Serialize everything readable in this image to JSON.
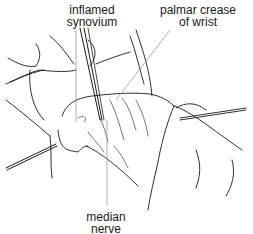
{
  "figure": {
    "labels": {
      "inflamed_synovium": {
        "line1": "inflamed",
        "line2": "synovium"
      },
      "palmar_crease": {
        "line1": "palmar crease",
        "line2": "of wrist"
      },
      "median_nerve": {
        "line1": "median",
        "line2": "nerve"
      }
    },
    "colors": {
      "ink": "#1a1a1a",
      "leader": "#9a9a9a",
      "background": "#ffffff"
    }
  }
}
